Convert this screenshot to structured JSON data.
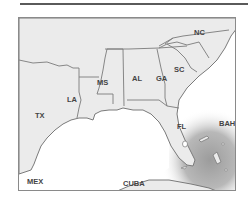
{
  "map": {
    "type": "regional map",
    "region": "Southeastern United States and Gulf of Mexico",
    "labels": {
      "tx": "TX",
      "la": "LA",
      "ms": "MS",
      "al": "AL",
      "ga": "GA",
      "sc": "SC",
      "nc": "NC",
      "fl": "FL",
      "bah": "BAH",
      "cuba": "CUBA",
      "mex": "MEX"
    },
    "shaded_area": "Ocean east and south of Florida toward Bahamas and Cuba",
    "colors": {
      "land": "#ebebeb",
      "border": "#7a7a7a",
      "water": "#ffffff",
      "shade": "#a8a8a8",
      "frame": "#8a8a8a"
    }
  }
}
